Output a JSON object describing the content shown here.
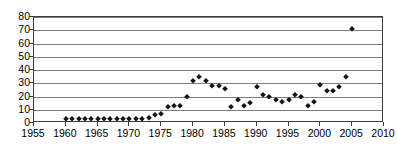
{
  "chart_data": {
    "type": "scatter",
    "title": "",
    "xlabel": "",
    "ylabel": "",
    "xlim": [
      1955,
      2010
    ],
    "ylim": [
      0,
      80
    ],
    "xticks": [
      1955,
      1960,
      1965,
      1970,
      1975,
      1980,
      1985,
      1990,
      1995,
      2000,
      2005,
      2010
    ],
    "yticks": [
      0,
      10,
      20,
      30,
      40,
      50,
      60,
      70,
      80
    ],
    "grid": "horizontal",
    "legend": "none",
    "marker": "diamond",
    "marker_color": "#151515",
    "series": [
      {
        "name": "series-1",
        "points": [
          {
            "x": 1960,
            "y": 3
          },
          {
            "x": 1961,
            "y": 3
          },
          {
            "x": 1962,
            "y": 3
          },
          {
            "x": 1963,
            "y": 3
          },
          {
            "x": 1964,
            "y": 3
          },
          {
            "x": 1965,
            "y": 3
          },
          {
            "x": 1966,
            "y": 3
          },
          {
            "x": 1967,
            "y": 3
          },
          {
            "x": 1968,
            "y": 3
          },
          {
            "x": 1969,
            "y": 3
          },
          {
            "x": 1970,
            "y": 3
          },
          {
            "x": 1971,
            "y": 3
          },
          {
            "x": 1972,
            "y": 3
          },
          {
            "x": 1973,
            "y": 4
          },
          {
            "x": 1974,
            "y": 6
          },
          {
            "x": 1975,
            "y": 7
          },
          {
            "x": 1976,
            "y": 12
          },
          {
            "x": 1977,
            "y": 13
          },
          {
            "x": 1978,
            "y": 13
          },
          {
            "x": 1979,
            "y": 20
          },
          {
            "x": 1980,
            "y": 32
          },
          {
            "x": 1981,
            "y": 35
          },
          {
            "x": 1982,
            "y": 32
          },
          {
            "x": 1983,
            "y": 28
          },
          {
            "x": 1984,
            "y": 28
          },
          {
            "x": 1985,
            "y": 26
          },
          {
            "x": 1986,
            "y": 12
          },
          {
            "x": 1987,
            "y": 17
          },
          {
            "x": 1988,
            "y": 13
          },
          {
            "x": 1989,
            "y": 15
          },
          {
            "x": 1990,
            "y": 27
          },
          {
            "x": 1991,
            "y": 21
          },
          {
            "x": 1992,
            "y": 20
          },
          {
            "x": 1993,
            "y": 17
          },
          {
            "x": 1994,
            "y": 16
          },
          {
            "x": 1995,
            "y": 17
          },
          {
            "x": 1996,
            "y": 21
          },
          {
            "x": 1997,
            "y": 20
          },
          {
            "x": 1998,
            "y": 13
          },
          {
            "x": 1999,
            "y": 16
          },
          {
            "x": 2000,
            "y": 29
          },
          {
            "x": 2001,
            "y": 24
          },
          {
            "x": 2002,
            "y": 24
          },
          {
            "x": 2003,
            "y": 27
          },
          {
            "x": 2004,
            "y": 35
          },
          {
            "x": 2005,
            "y": 71
          }
        ]
      }
    ]
  }
}
